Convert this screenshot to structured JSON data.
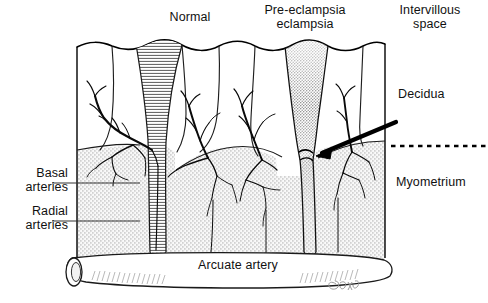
{
  "figure": {
    "background_color": "#ffffff",
    "ink_color": "#000000",
    "myometrium_fill": "#c9c9c9"
  },
  "labels": {
    "normal": "Normal",
    "preeclampsia": "Pre-eclampsia\neclampsia",
    "intervillous_space": "Intervillous\nspace",
    "decidua": "Decidua",
    "myometrium": "Myometrium",
    "basal_arteries": "Basal\narteries",
    "radial_arteries": "Radial\narteries",
    "arcuate_artery": "Arcuate artery"
  },
  "annotations": {
    "decidua_arrow": "arrow pointing from Decidua label down-left to the constricted spiral artery",
    "decidua_myometrium_boundary": "dotted horizontal line marking the decidua / myometrium junction",
    "basal_leader": "horizontal leader line from Basal arteries label to tissue block",
    "radial_leader": "horizontal leader line from Radial arteries label to tissue block",
    "signature": "artist signature at lower right"
  },
  "structures": [
    {
      "name": "normal-spiral-artery",
      "description": "wide funnel-shaped dilated channel opening into intervillous space, horizontally hatched"
    },
    {
      "name": "preeclampsia-spiral-artery",
      "description": "narrow constricted channel with dense stippling, failure of physiological remodelling"
    },
    {
      "name": "basal-artery-tree",
      "description": "branching arterial tree arising in the myometrium"
    },
    {
      "name": "radial-artery-tree",
      "description": "branching arterial tree within the myometrium"
    },
    {
      "name": "arcuate-artery",
      "description": "horizontal cylindrical vessel at base of myometrium, cut open at left end"
    }
  ]
}
